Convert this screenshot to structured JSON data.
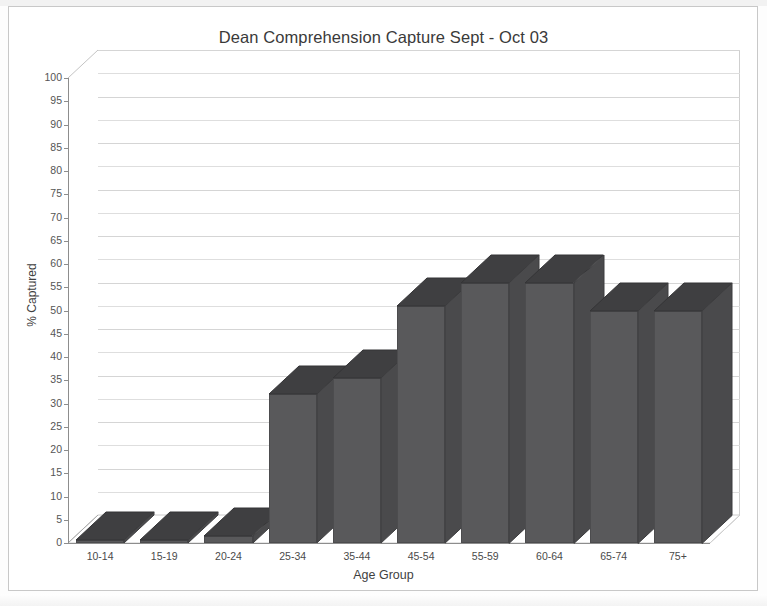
{
  "chart_data": {
    "type": "bar",
    "title": "Dean Comprehension Capture Sept - Oct 03",
    "xlabel": "Age Group",
    "ylabel": "% Captured",
    "categories": [
      "10-14",
      "15-19",
      "20-24",
      "25-34",
      "35-44",
      "45-54",
      "55-59",
      "60-64",
      "65-74",
      "75+"
    ],
    "values": [
      0.5,
      0.5,
      1.5,
      32,
      35.5,
      51,
      56,
      56,
      50,
      50
    ],
    "ylim": [
      0,
      100
    ],
    "ytick_step": 5,
    "yticks": [
      100,
      95,
      90,
      85,
      80,
      75,
      70,
      65,
      60,
      55,
      50,
      45,
      40,
      35,
      30,
      25,
      20,
      15,
      10,
      5,
      0
    ],
    "grid": true,
    "legend": "none",
    "style_3d": true,
    "bar_color": "#59595b",
    "bar_top_color": "#3f3f41",
    "bar_side_color": "#4a4a4c",
    "axis_color": "#8d8d8d",
    "grid_color": "#dedede",
    "background": "#ffffff"
  }
}
